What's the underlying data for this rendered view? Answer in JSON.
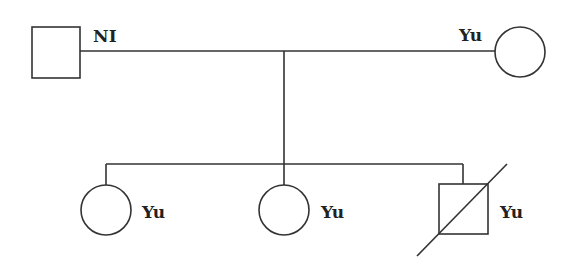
{
  "diagram": {
    "type": "pedigree",
    "stroke_color": "#333333",
    "generation_1": {
      "father": {
        "shape": "square",
        "sex": "male",
        "label": "NI",
        "deceased": false
      },
      "mother": {
        "shape": "circle",
        "sex": "female",
        "label": "Yu",
        "deceased": false
      }
    },
    "generation_2": [
      {
        "shape": "circle",
        "sex": "female",
        "label": "Yu",
        "deceased": false
      },
      {
        "shape": "circle",
        "sex": "female",
        "label": "Yu",
        "deceased": false
      },
      {
        "shape": "square",
        "sex": "male",
        "label": "Yu",
        "deceased": true
      }
    ]
  }
}
